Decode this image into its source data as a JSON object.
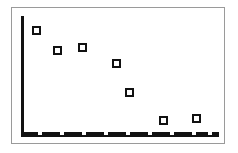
{
  "chart_data": {
    "type": "scatter",
    "title": "",
    "subtitle": "",
    "xlabel": "",
    "ylabel": "",
    "legend": [],
    "legend_position": "none",
    "grid": false,
    "xlim": [
      0,
      10
    ],
    "ylim": [
      0,
      10
    ],
    "xticks": [
      1,
      2,
      3,
      4,
      5,
      6,
      7,
      8,
      9
    ],
    "xticklabels": [
      "",
      "",
      "",
      "",
      "",
      "",
      "",
      "",
      ""
    ],
    "yticks": [],
    "yticklabels": [],
    "marker_style": "open-square",
    "marker_edge_color": "#111111",
    "marker_face_color": "#ffffff",
    "axis_color": "#111111",
    "frame_color": "#9a9a9a",
    "background_color": "#ffffff",
    "series": [
      {
        "name": "series-1",
        "x": [
          0.75,
          1.8,
          3.05,
          4.75,
          5.4,
          7.1,
          8.8
        ],
        "y": [
          8.75,
          7.05,
          7.3,
          5.95,
          3.55,
          1.3,
          1.45
        ],
        "points": [
          {
            "px": 36,
            "py": 30
          },
          {
            "px": 57,
            "py": 50
          },
          {
            "px": 82,
            "py": 47
          },
          {
            "px": 116,
            "py": 63
          },
          {
            "px": 129,
            "py": 92
          },
          {
            "px": 163,
            "py": 120
          },
          {
            "px": 196,
            "py": 118
          }
        ]
      }
    ],
    "tick_positions_px": [
      40,
      62,
      84,
      106,
      128,
      150,
      172,
      194,
      210
    ],
    "annotations": []
  },
  "figure": {
    "frame": {
      "left": 11,
      "top": 7,
      "width": 214,
      "height": 137
    },
    "y_axis": {
      "left": 21,
      "top": 16,
      "width": 3,
      "height": 121
    },
    "x_axis": {
      "left": 21,
      "top": 132,
      "width": 198,
      "height": 5
    }
  }
}
